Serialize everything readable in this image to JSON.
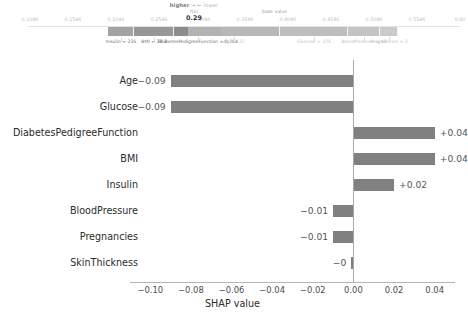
{
  "force_plot": {
    "higher_label": "higher",
    "lower_label": "lower",
    "arrow_glyph": "→ ←",
    "fx_label": "f(x)",
    "fx_value": "0.29",
    "base_value_label": "base value",
    "axis_ticks": [
      "0.1046",
      "0.1546",
      "0.2046",
      "0.2546",
      "0.3046",
      "0.3546",
      "0.4046",
      "0.4546",
      "0.5046",
      "0.5546",
      "0.60"
    ],
    "fx_tick_overlap": "0.3046",
    "negative_features": [
      {
        "label": "Insulin = 235"
      },
      {
        "label": "BMI = 38.3"
      },
      {
        "label": "DiabetesPedigreeFunction = 0.704"
      }
    ],
    "positive_features": [
      {
        "label": "Age = 37"
      },
      {
        "label": "Glucose = 125"
      },
      {
        "label": "BloodPressure = 48"
      },
      {
        "label": "Pregnancies = 3"
      }
    ]
  },
  "chart_data": {
    "type": "bar",
    "title": "",
    "xlabel": "SHAP value",
    "ylabel": "",
    "orientation": "horizontal",
    "grid": false,
    "legend": "none",
    "xlim": [
      -0.11,
      0.05
    ],
    "xticks": [
      "−0.10",
      "−0.08",
      "−0.06",
      "−0.04",
      "−0.02",
      "0.00",
      "0.02",
      "0.04"
    ],
    "xtick_values": [
      -0.1,
      -0.08,
      -0.06,
      -0.04,
      -0.02,
      0.0,
      0.02,
      0.04
    ],
    "categories": [
      "Age",
      "Glucose",
      "DiabetesPedigreeFunction",
      "BMI",
      "Insulin",
      "BloodPressure",
      "Pregnancies",
      "SkinThickness"
    ],
    "values": [
      -0.09,
      -0.09,
      0.04,
      0.04,
      0.02,
      -0.01,
      -0.01,
      -0.001
    ],
    "value_labels": [
      "−0.09",
      "−0.09",
      "+0.04",
      "+0.04",
      "+0.02",
      "−0.01",
      "−0.01",
      "−0"
    ],
    "bars": [
      {
        "category": "Age",
        "value": -0.09,
        "label": "−0.09",
        "sign": "neg"
      },
      {
        "category": "Glucose",
        "value": -0.09,
        "label": "−0.09",
        "sign": "neg"
      },
      {
        "category": "DiabetesPedigreeFunction",
        "value": 0.04,
        "label": "+0.04",
        "sign": "pos"
      },
      {
        "category": "BMI",
        "value": 0.04,
        "label": "+0.04",
        "sign": "pos"
      },
      {
        "category": "Insulin",
        "value": 0.02,
        "label": "+0.02",
        "sign": "pos"
      },
      {
        "category": "BloodPressure",
        "value": -0.01,
        "label": "−0.01",
        "sign": "neg"
      },
      {
        "category": "Pregnancies",
        "value": -0.01,
        "label": "−0.01",
        "sign": "neg"
      },
      {
        "category": "SkinThickness",
        "value": -0.001,
        "label": "−0",
        "sign": "neg"
      }
    ]
  },
  "colors": {
    "bar": "#808080",
    "force_negative": "#7f7f7f",
    "force_positive": "#b4b4b4",
    "axis": "#b5b5b5",
    "text": "#2b2b2b"
  }
}
